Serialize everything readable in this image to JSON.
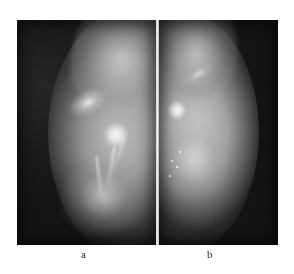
{
  "figure": {
    "type": "medical-radiograph-pair",
    "modality": "mammogram",
    "panel_count": 2,
    "plate_background_color": "#151515",
    "page_background_color": "#ffffff"
  },
  "panels": [
    {
      "id": "a",
      "label": "a",
      "position": "left",
      "description_tissue_side": "right",
      "description_background_side": "left",
      "tones": {
        "background": "#1a1a1a",
        "tissue_mid": "#a8a8a8",
        "tissue_bright": "#e4e4e4",
        "lesion_peak": "#fcfcfc"
      }
    },
    {
      "id": "b",
      "label": "b",
      "position": "right",
      "description_tissue_side": "left",
      "description_background_side": "right",
      "tones": {
        "background": "#1d1d1d",
        "tissue_mid": "#b0b0b0",
        "tissue_bright": "#e6e6e6",
        "lesion_peak": "#fdfdfd"
      }
    }
  ],
  "divider": {
    "name": "panel-divider",
    "color": "#f2f2f2",
    "orientation": "vertical"
  },
  "caption": {
    "label_a": "a",
    "label_b": "b"
  }
}
